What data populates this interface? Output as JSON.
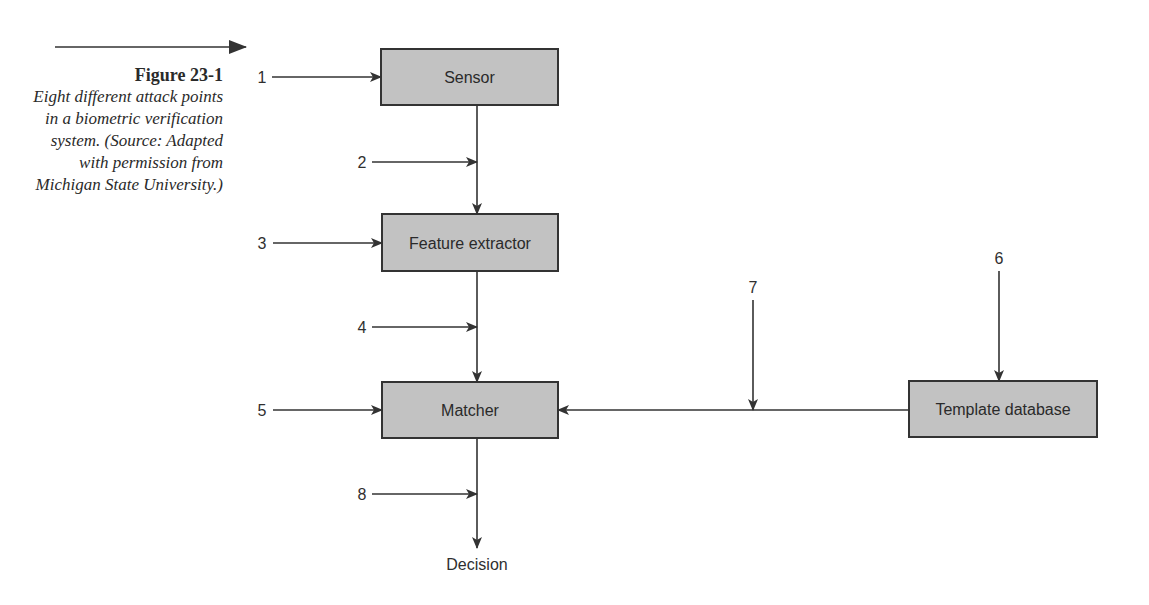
{
  "caption": {
    "figure_label": "Figure 23-1",
    "text": "Eight different attack points in a biometric verification system. (Source: Adapted with permission from Michigan State University.)"
  },
  "diagram": {
    "title": "Eight different attack points in a biometric verification system",
    "nodes": [
      {
        "id": "sensor",
        "label": "Sensor"
      },
      {
        "id": "feature_extractor",
        "label": "Feature extractor"
      },
      {
        "id": "matcher",
        "label": "Matcher"
      },
      {
        "id": "template_database",
        "label": "Template database"
      },
      {
        "id": "decision",
        "label": "Decision"
      }
    ],
    "edges": [
      {
        "from": "sensor",
        "to": "feature_extractor"
      },
      {
        "from": "feature_extractor",
        "to": "matcher"
      },
      {
        "from": "template_database",
        "to": "matcher"
      },
      {
        "from": "matcher",
        "to": "decision"
      }
    ],
    "attack_points": [
      {
        "num": "1",
        "target": "Sensor input"
      },
      {
        "num": "2",
        "target": "Sensor → Feature extractor channel"
      },
      {
        "num": "3",
        "target": "Feature extractor"
      },
      {
        "num": "4",
        "target": "Feature extractor → Matcher channel"
      },
      {
        "num": "5",
        "target": "Matcher"
      },
      {
        "num": "6",
        "target": "Template database"
      },
      {
        "num": "7",
        "target": "Template database → Matcher channel"
      },
      {
        "num": "8",
        "target": "Matcher → Decision channel"
      }
    ]
  },
  "labels": {
    "sensor": "Sensor",
    "feature_extractor": "Feature extractor",
    "matcher": "Matcher",
    "template_database": "Template database",
    "decision": "Decision",
    "n1": "1",
    "n2": "2",
    "n3": "3",
    "n4": "4",
    "n5": "5",
    "n6": "6",
    "n7": "7",
    "n8": "8"
  }
}
